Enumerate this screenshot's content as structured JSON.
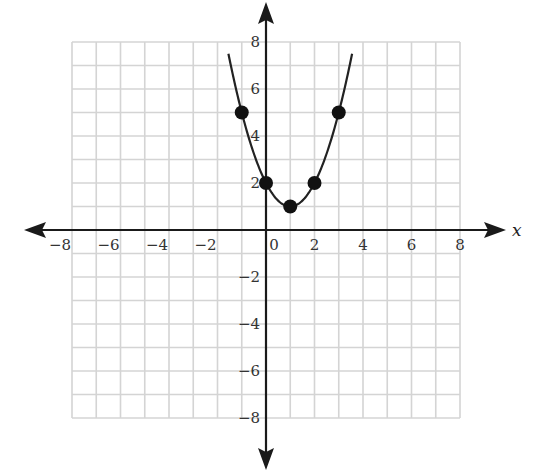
{
  "chart_data": {
    "type": "line",
    "title": "",
    "xlabel": "x",
    "ylabel": "",
    "xlim": [
      -8,
      8
    ],
    "ylim": [
      -8,
      8
    ],
    "grid": true,
    "grid_step": 1,
    "x_ticks": [
      -8,
      -6,
      -4,
      -2,
      0,
      2,
      4,
      6,
      8
    ],
    "y_ticks": [
      -8,
      -6,
      -4,
      -2,
      2,
      4,
      6,
      8
    ],
    "x_tick_labels": [
      "−8",
      "−6",
      "−4",
      "−2",
      "0",
      "2",
      "4",
      "6",
      "8"
    ],
    "y_tick_labels": [
      "−8",
      "−6",
      "−4",
      "−2",
      "2",
      "4",
      "6",
      "8"
    ],
    "series": [
      {
        "name": "parabola",
        "kind": "curve",
        "equation": "y = x^2 - 2x + 2",
        "x_range": [
          -1.55,
          3.55
        ],
        "color": "#222222"
      },
      {
        "name": "plotted points",
        "kind": "scatter",
        "points": [
          {
            "x": -1,
            "y": 5
          },
          {
            "x": 0,
            "y": 2
          },
          {
            "x": 1,
            "y": 1
          },
          {
            "x": 2,
            "y": 2
          },
          {
            "x": 3,
            "y": 5
          }
        ],
        "color": "#111111"
      }
    ],
    "legend": null
  },
  "axes": {
    "x_label": "x"
  },
  "colors": {
    "grid": "#d4d4d4",
    "axis": "#1a1a1a",
    "curve": "#222222",
    "points": "#111111"
  }
}
